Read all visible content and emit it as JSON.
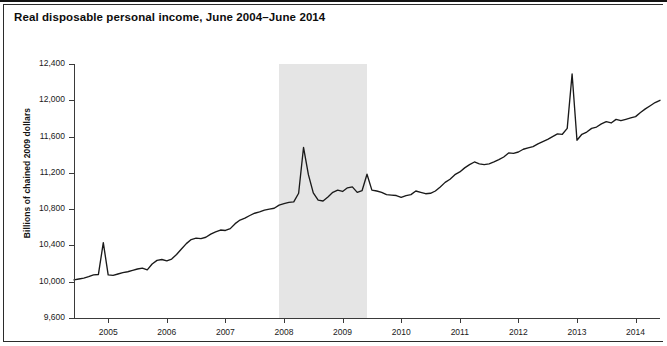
{
  "figure": {
    "title": "Real disposable personal income, June 2004–June 2014",
    "axis_color": "#3a3a3a",
    "line_color": "#1a1a1a",
    "band_color": "#e3e3e3",
    "background": "#ffffff"
  },
  "chart_data": {
    "type": "line",
    "title": "Real disposable personal income, June 2004–June 2014",
    "subtitle": "",
    "xlabel": "",
    "ylabel": "Billions of chained 2009 dollars",
    "ylim": [
      9600,
      12400
    ],
    "yticks": [
      9600,
      10000,
      10400,
      10800,
      11200,
      11600,
      12000,
      12400
    ],
    "ytick_labels": [
      "9,600",
      "10,000",
      "10,400",
      "10,800",
      "11,200",
      "11,600",
      "12,000",
      "12,400"
    ],
    "xlim": [
      "2004-06",
      "2014-06"
    ],
    "xticks": [
      "2005",
      "2006",
      "2007",
      "2008",
      "2009",
      "2010",
      "2011",
      "2012",
      "2013",
      "2014"
    ],
    "xtick_labels": [
      "2005",
      "2006",
      "2007",
      "2008",
      "2009",
      "2010",
      "2011",
      "2012",
      "2013",
      "2014"
    ],
    "grid": false,
    "legend": "none",
    "annotations": [
      {
        "name": "recession-band",
        "kind": "shaded-span",
        "label": "",
        "x_start": "2007-12",
        "x_end": "2009-06",
        "color": "#e3e3e3"
      }
    ],
    "series": [
      {
        "name": "Real disposable personal income",
        "color": "#1a1a1a",
        "x": [
          "2004-06",
          "2004-07",
          "2004-08",
          "2004-09",
          "2004-10",
          "2004-11",
          "2004-12",
          "2005-01",
          "2005-02",
          "2005-03",
          "2005-04",
          "2005-05",
          "2005-06",
          "2005-07",
          "2005-08",
          "2005-09",
          "2005-10",
          "2005-11",
          "2005-12",
          "2006-01",
          "2006-02",
          "2006-03",
          "2006-04",
          "2006-05",
          "2006-06",
          "2006-07",
          "2006-08",
          "2006-09",
          "2006-10",
          "2006-11",
          "2006-12",
          "2007-01",
          "2007-02",
          "2007-03",
          "2007-04",
          "2007-05",
          "2007-06",
          "2007-07",
          "2007-08",
          "2007-09",
          "2007-10",
          "2007-11",
          "2007-12",
          "2008-01",
          "2008-02",
          "2008-03",
          "2008-04",
          "2008-05",
          "2008-06",
          "2008-07",
          "2008-08",
          "2008-09",
          "2008-10",
          "2008-11",
          "2008-12",
          "2009-01",
          "2009-02",
          "2009-03",
          "2009-04",
          "2009-05",
          "2009-06",
          "2009-07",
          "2009-08",
          "2009-09",
          "2009-10",
          "2009-11",
          "2009-12",
          "2010-01",
          "2010-02",
          "2010-03",
          "2010-04",
          "2010-05",
          "2010-06",
          "2010-07",
          "2010-08",
          "2010-09",
          "2010-10",
          "2010-11",
          "2010-12",
          "2011-01",
          "2011-02",
          "2011-03",
          "2011-04",
          "2011-05",
          "2011-06",
          "2011-07",
          "2011-08",
          "2011-09",
          "2011-10",
          "2011-11",
          "2011-12",
          "2012-01",
          "2012-02",
          "2012-03",
          "2012-04",
          "2012-05",
          "2012-06",
          "2012-07",
          "2012-08",
          "2012-09",
          "2012-10",
          "2012-11",
          "2012-12",
          "2013-01",
          "2013-02",
          "2013-03",
          "2013-04",
          "2013-05",
          "2013-06",
          "2013-07",
          "2013-08",
          "2013-09",
          "2013-10",
          "2013-11",
          "2013-12",
          "2014-01",
          "2014-02",
          "2014-03",
          "2014-04",
          "2014-05",
          "2014-06"
        ],
        "values": [
          10020,
          10030,
          10040,
          10055,
          10075,
          10080,
          10430,
          10075,
          10070,
          10085,
          10100,
          10110,
          10125,
          10140,
          10150,
          10130,
          10195,
          10235,
          10245,
          10230,
          10250,
          10300,
          10360,
          10420,
          10465,
          10480,
          10475,
          10490,
          10525,
          10550,
          10570,
          10565,
          10585,
          10640,
          10680,
          10700,
          10730,
          10755,
          10770,
          10790,
          10800,
          10810,
          10845,
          10860,
          10875,
          10880,
          10975,
          11480,
          11180,
          10980,
          10900,
          10890,
          10935,
          10985,
          11010,
          10995,
          11035,
          11045,
          10985,
          11005,
          11185,
          11010,
          11000,
          10985,
          10960,
          10955,
          10950,
          10930,
          10950,
          10960,
          11000,
          10985,
          10970,
          10975,
          11000,
          11045,
          11095,
          11130,
          11180,
          11210,
          11255,
          11290,
          11320,
          11300,
          11290,
          11300,
          11320,
          11345,
          11375,
          11420,
          11415,
          11430,
          11460,
          11475,
          11490,
          11520,
          11545,
          11570,
          11600,
          11630,
          11625,
          11690,
          12290,
          11560,
          11625,
          11650,
          11690,
          11705,
          11740,
          11765,
          11750,
          11790,
          11775,
          11790,
          11805,
          11820,
          11865,
          11905,
          11940,
          11975,
          12000
        ]
      }
    ]
  }
}
